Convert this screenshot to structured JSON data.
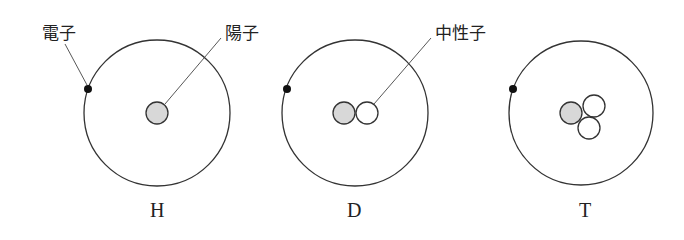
{
  "labels": {
    "electron": "電子",
    "proton": "陽子",
    "neutron": "中性子"
  },
  "atoms": [
    {
      "symbol": "H",
      "protons": 1,
      "neutrons": 0,
      "electrons": 1
    },
    {
      "symbol": "D",
      "protons": 1,
      "neutrons": 1,
      "electrons": 1
    },
    {
      "symbol": "T",
      "protons": 1,
      "neutrons": 2,
      "electrons": 1
    }
  ],
  "colors": {
    "proton_fill": "#d8d8d8",
    "neutron_fill": "#ffffff",
    "electron_fill": "#111111",
    "stroke": "#333333"
  }
}
